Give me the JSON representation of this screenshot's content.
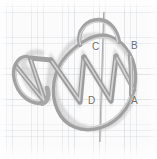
{
  "figure": {
    "medium": "pencil sketch on graph paper",
    "background_color": "#fbfbfb",
    "grid_color": "#96a0af",
    "stroke_color": "#9d9d9d",
    "stroke_highlight_color": "#cfcfcf",
    "label_color": "#6d6d6d",
    "labels": [
      {
        "id": "A",
        "text": "A",
        "x": 131,
        "y": 101
      },
      {
        "id": "B",
        "text": "B",
        "x": 131,
        "y": 46
      },
      {
        "id": "C",
        "text": "C",
        "x": 92,
        "y": 47
      },
      {
        "id": "D",
        "text": "D",
        "x": 88,
        "y": 101
      }
    ],
    "elements": [
      {
        "name": "vertical-axis-line",
        "description": "vertical straight line through the centre of the circle"
      },
      {
        "name": "circle-loop",
        "description": "large hand-drawn circle / ring"
      },
      {
        "name": "top-hook-arc",
        "description": "arc hooking over the top-left of the circle"
      },
      {
        "name": "zigzag-helix",
        "description": "zigzag / helix wire running left to right across the circle"
      },
      {
        "name": "left-loop",
        "description": "elongated closed loop at the far left of the helix"
      },
      {
        "name": "right-tail-segment",
        "description": "short vertical wire segment from B down to A at the right"
      }
    ]
  }
}
